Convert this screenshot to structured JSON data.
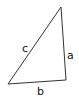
{
  "diagram": {
    "type": "triangle",
    "stroke_color": "#333333",
    "labels": {
      "side_a": "a",
      "side_b": "b",
      "side_c": "c"
    }
  }
}
